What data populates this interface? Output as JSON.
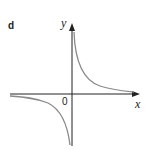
{
  "diagram": {
    "panel_label": "d",
    "axes": {
      "x_label": "x",
      "y_label": "y",
      "origin_label": "0"
    },
    "curve": {
      "description": "rectangular hyperbola y = k/x with k > 0, branches in quadrants I and III",
      "color": "#8a8a8a"
    },
    "axis_color": "#222222"
  }
}
